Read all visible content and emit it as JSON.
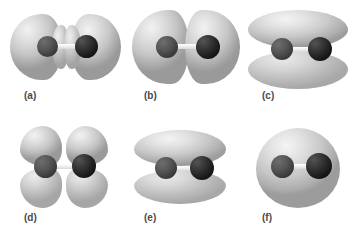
{
  "figure": {
    "background_color": "#ffffff",
    "width": 359,
    "height": 242,
    "columns": 3,
    "rows": 2,
    "colors": {
      "lobe_light": "#f2f2f2",
      "lobe_mid": "#c6c6c6",
      "lobe_dark": "#9a9a9a",
      "atom_left": "#565656",
      "atom_right": "#161616",
      "bond": "#f0f0f0",
      "caption_text": "#4a4a4a"
    }
  },
  "panels": [
    {
      "id": "a",
      "caption": "(a)",
      "orbital_name": "sigma-antibonding",
      "lobe_count": 4,
      "description": "Two large outer hemispherical lobes plus two small inner lobes separated by a node between the atoms",
      "atoms": 2
    },
    {
      "id": "b",
      "caption": "(b)",
      "orbital_name": "sigma-antibonding-large",
      "lobe_count": 2,
      "description": "Two large lobes meeting at a node at the midpoint of the bond",
      "atoms": 2
    },
    {
      "id": "c",
      "caption": "(c)",
      "orbital_name": "pi-bonding",
      "lobe_count": 2,
      "description": "One broad elongated lobe above and one below the internuclear axis",
      "atoms": 2
    },
    {
      "id": "d",
      "caption": "(d)",
      "orbital_name": "pi-antibonding",
      "lobe_count": 4,
      "description": "Four teardrop lobes in quadrants, nodes along and across the bond axis",
      "atoms": 2
    },
    {
      "id": "e",
      "caption": "(e)",
      "orbital_name": "pi-bonding-compact",
      "lobe_count": 2,
      "description": "Upper and lower lobes slightly smaller and rounder than panel c",
      "atoms": 2
    },
    {
      "id": "f",
      "caption": "(f)",
      "orbital_name": "sigma-bonding",
      "lobe_count": 1,
      "description": "Single continuous ellipsoidal lobe enclosing both atoms",
      "atoms": 2
    }
  ]
}
